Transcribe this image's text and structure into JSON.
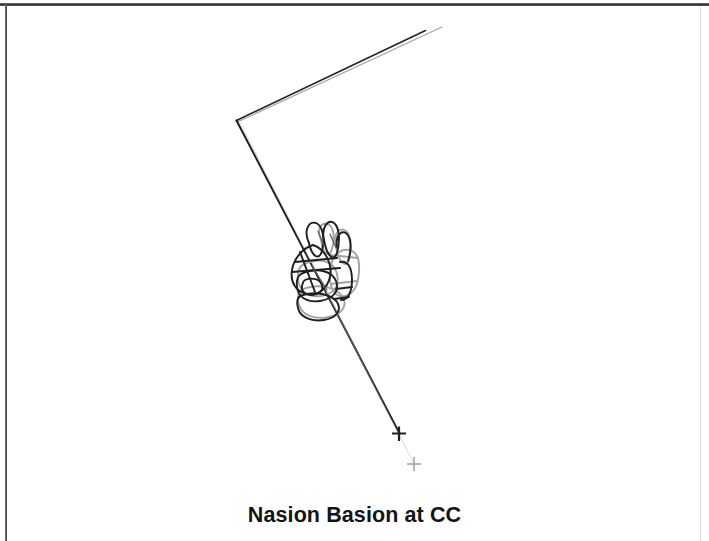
{
  "figure": {
    "caption": "Nasion Basion at CC",
    "type": "cephalometric-superimposition-tracing",
    "background_color": "#ffffff",
    "border": {
      "top_color": "#2e2e2e",
      "left_color": "#3a3a3a",
      "right_color": "#e2e2e2"
    },
    "colors": {
      "dark_trace": "#1f1f1f",
      "gray_trace": "#9a9a9a",
      "mid_trace": "#5d5d5d",
      "caption_text": "#141414"
    },
    "reference_line": {
      "name": "nasion-basion-plane",
      "vertex": {
        "x": 237,
        "y": 120
      },
      "upper_arm_dark_end": {
        "x": 425,
        "y": 30
      },
      "upper_arm_gray_end": {
        "x": 442,
        "y": 27
      },
      "lower_arm_end": {
        "x": 400,
        "y": 434
      }
    },
    "registration_markers": [
      {
        "name": "cross-marker-dark",
        "x": 399,
        "y": 433,
        "size": 13,
        "color": "#1f1f1f"
      },
      {
        "name": "cross-marker-gray",
        "x": 414,
        "y": 464,
        "size": 13,
        "color": "#9a9a9a"
      }
    ],
    "vertebrae_cluster": {
      "name": "superimposed-vertebrae-tracings",
      "center": {
        "x": 325,
        "y": 265
      },
      "bounds": {
        "x": 288,
        "y": 218,
        "width": 72,
        "height": 100
      },
      "dark_outline_count": 5,
      "gray_outline_count": 5
    }
  }
}
